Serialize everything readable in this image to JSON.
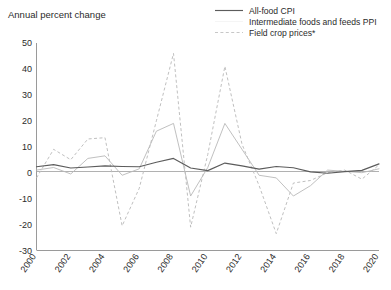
{
  "chart_data": {
    "type": "line",
    "title": "Annual percent change",
    "xlabel": "",
    "ylabel": "Annual percent change",
    "xlim": [
      2000,
      2020
    ],
    "ylim": [
      -30,
      50
    ],
    "grid": false,
    "legend_position": "top-right",
    "x": [
      2000,
      2001,
      2002,
      2003,
      2004,
      2005,
      2006,
      2007,
      2008,
      2009,
      2010,
      2011,
      2012,
      2013,
      2014,
      2015,
      2016,
      2017,
      2018,
      2019,
      2020
    ],
    "y_ticks": [
      50,
      40,
      30,
      20,
      10,
      0,
      -10,
      -20,
      -30
    ],
    "x_ticks": [
      2000,
      2002,
      2004,
      2006,
      2008,
      2010,
      2012,
      2014,
      2016,
      2018,
      2020
    ],
    "series": [
      {
        "name": "All-food CPI",
        "style": "solid",
        "color": "#5c5c5c",
        "values": [
          2.3,
          3.1,
          1.8,
          2.2,
          2.6,
          2.4,
          2.3,
          4.0,
          5.5,
          1.8,
          0.8,
          3.7,
          2.6,
          1.4,
          2.4,
          1.9,
          0.3,
          -0.2,
          0.4,
          0.9,
          3.4
        ]
      },
      {
        "name": "Intermediate foods and feeds PPI",
        "style": "solid",
        "color": "#b9b9b9",
        "values": [
          1.0,
          2.0,
          -0.5,
          5.5,
          6.5,
          -1.0,
          1.5,
          16.0,
          19.0,
          -9.0,
          2.0,
          19.0,
          9.0,
          -1.0,
          -2.0,
          -9.0,
          -5.0,
          1.0,
          0.5,
          0.0,
          1.5
        ]
      },
      {
        "name": "Field crop prices*",
        "style": "dashed",
        "color": "#bcbcbc",
        "values": [
          -2.0,
          9.0,
          5.0,
          13.0,
          13.5,
          -20.5,
          -6.0,
          20.0,
          46.0,
          -21.0,
          7.0,
          41.0,
          11.0,
          -5.0,
          -23.5,
          -4.0,
          -3.0,
          0.0,
          1.0,
          -2.5,
          3.0
        ]
      }
    ]
  },
  "legend": {
    "items": [
      {
        "label": "All-food CPI",
        "marker": "solid-dark"
      },
      {
        "label": "Intermediate foods and feeds PPI",
        "marker": "solid-light"
      },
      {
        "label": "Field crop prices*",
        "marker": "dashed-light"
      }
    ]
  },
  "axis": {
    "y_title": "Annual percent change"
  }
}
